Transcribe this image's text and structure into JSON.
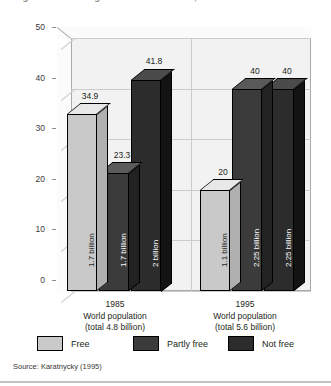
{
  "figure": {
    "title": "Figure: Political rights and civil liberties, 1985 and 1995",
    "source": "Source: Karatnycky (1995)"
  },
  "chart_data": {
    "type": "bar",
    "title": "Figure: Political rights and civil liberties, 1985 and 1995",
    "xlabel": "",
    "ylabel": "Per cent",
    "ylim": [
      0,
      50
    ],
    "yticks": [
      0,
      10,
      20,
      30,
      40,
      50
    ],
    "grid": true,
    "legend_position": "bottom",
    "categories": [
      "1985",
      "1995"
    ],
    "category_captions": [
      [
        "1985",
        "World population",
        "(total 4.8 billion)"
      ],
      [
        "1995",
        "World population",
        "(total 5.6 billion)"
      ]
    ],
    "series": [
      {
        "name": "Free",
        "color": "#c9c9c9",
        "values": [
          34.9,
          20
        ],
        "value_labels": [
          "34.9",
          "20"
        ],
        "bar_captions": [
          "1.7 billion",
          "1.1 billion"
        ],
        "caption_color": "#231f20"
      },
      {
        "name": "Partly free",
        "color": "#3b3b3b",
        "values": [
          23.3,
          40
        ],
        "value_labels": [
          "23.3",
          "40"
        ],
        "bar_captions": [
          "1.7 billion",
          "2.25 billion"
        ],
        "caption_color": "#ffffff"
      },
      {
        "name": "Not free",
        "color": "#2c2c2c",
        "values": [
          41.8,
          40
        ],
        "value_labels": [
          "41.8",
          "40"
        ],
        "bar_captions": [
          "2 billion",
          "2.25 billion"
        ],
        "caption_color": "#ffffff"
      }
    ]
  },
  "axis": {
    "y_title": "Per cent",
    "y_ticks": [
      "50",
      "40",
      "30",
      "20",
      "10",
      "0"
    ]
  },
  "legend": {
    "items": [
      {
        "label": "Free",
        "color": "#c9c9c9"
      },
      {
        "label": "Partly free",
        "color": "#3b3b3b"
      },
      {
        "label": "Not free",
        "color": "#2c2c2c"
      }
    ]
  }
}
